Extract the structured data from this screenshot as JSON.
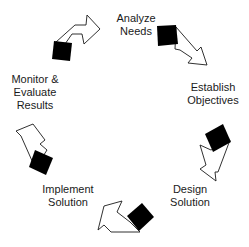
{
  "diagram": {
    "type": "cycle",
    "steps": [
      {
        "label_line1": "Analyze",
        "label_line2": "Needs"
      },
      {
        "label_line1": "Establish",
        "label_line2": "Objectives"
      },
      {
        "label_line1": "Design",
        "label_line2": "Solution"
      },
      {
        "label_line1": "Implement",
        "label_line2": "Solution"
      },
      {
        "label_line1": "Monitor &",
        "label_line2": "Evaluate",
        "label_line3": "Results"
      }
    ],
    "colors": {
      "block": "#000000",
      "arrow_fill": "#ffffff",
      "arrow_stroke": "#1a1a1a",
      "text": "#1a1a1a"
    }
  }
}
